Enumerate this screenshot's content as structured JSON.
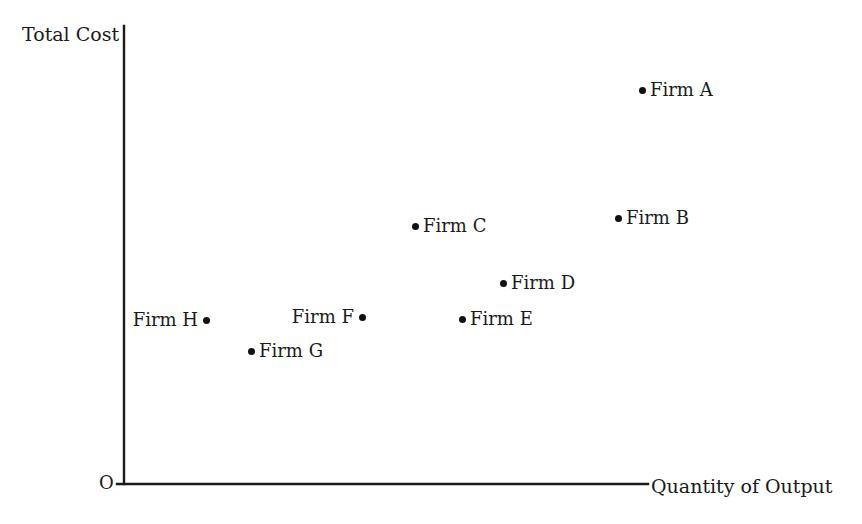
{
  "chart_data": {
    "type": "scatter",
    "title": "",
    "xlabel": "Quantity of Output",
    "ylabel": "Total Cost",
    "origin_label": "O",
    "grid": false,
    "legend": "none",
    "axis_note": "Axes are unlabeled/unscaled; values are relative pixel-derived positions",
    "xlim": [
      0,
      100
    ],
    "ylim": [
      0,
      100
    ],
    "categories": [
      "Firm A",
      "Firm B",
      "Firm C",
      "Firm D",
      "Firm E",
      "Firm F",
      "Firm G",
      "Firm H"
    ],
    "points": [
      {
        "name": "Firm A",
        "x": 98.7,
        "y": 86.1,
        "px": 642,
        "py": 90,
        "label_side": "right"
      },
      {
        "name": "Firm B",
        "x": 93.2,
        "y": 58.0,
        "px": 618,
        "py": 218,
        "label_side": "right"
      },
      {
        "name": "Firm C",
        "x": 55.1,
        "y": 56.4,
        "px": 415,
        "py": 226,
        "label_side": "right"
      },
      {
        "name": "Firm D",
        "x": 72.7,
        "y": 43.9,
        "px": 503,
        "py": 283,
        "label_side": "right"
      },
      {
        "name": "Firm E",
        "x": 64.5,
        "y": 36.0,
        "px": 462,
        "py": 319,
        "label_side": "right"
      },
      {
        "name": "Firm F",
        "x": 44.6,
        "y": 36.5,
        "px": 362,
        "py": 317,
        "label_side": "left"
      },
      {
        "name": "Firm G",
        "x": 22.4,
        "y": 29.0,
        "px": 251,
        "py": 351,
        "label_side": "right"
      },
      {
        "name": "Firm H",
        "x": 13.4,
        "y": 35.8,
        "px": 206,
        "py": 320,
        "label_side": "left"
      }
    ]
  },
  "axes": {
    "y": {
      "x": 124,
      "top": 26,
      "bottom": 484
    },
    "x": {
      "y": 484,
      "left": 117,
      "right": 648
    }
  }
}
